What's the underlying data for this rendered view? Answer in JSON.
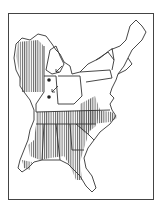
{
  "map": {
    "region": "Eastern United States",
    "type": "species range map",
    "legend": {
      "hatched": "range",
      "dots": "isolated occurrences"
    },
    "colors": {
      "outline": "#333333",
      "hatch": "#555555",
      "background": "#ffffff"
    },
    "range_areas": [
      "Wisconsin",
      "Illinois (north)",
      "Southeast (Tennessee to Florida)",
      "Carolinas",
      "Gulf Coast"
    ],
    "markers": [
      {
        "type": "dot",
        "location": "Indiana west"
      },
      {
        "type": "dot",
        "location": "Indiana south"
      },
      {
        "type": "arrow",
        "location": "Michigan"
      },
      {
        "type": "arrow",
        "location": "Indiana"
      }
    ]
  }
}
